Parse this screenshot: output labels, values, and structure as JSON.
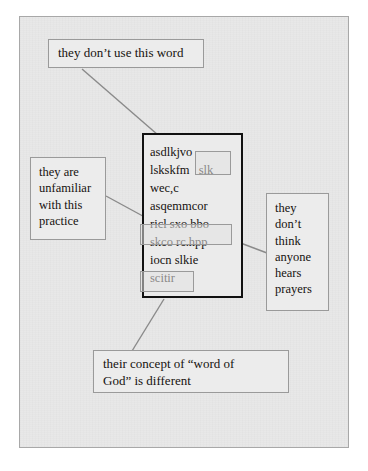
{
  "figure": {
    "type": "annotated-text-diagram",
    "top_cut_text": " ",
    "text_block": {
      "label": "central-passage",
      "lines": [
        "asdlkjvo",
        "lskskfm",
        "wec,c",
        "asqemmcor",
        "ricl sxo",
        "skco rc.hpp",
        "iocn slkie",
        "scitir"
      ],
      "highlights": [
        {
          "name": "slk",
          "text": "slk"
        },
        {
          "name": "bbo",
          "text": "bbo"
        },
        {
          "name": "scitir",
          "text": "scitir"
        }
      ]
    },
    "callouts": {
      "top": {
        "name": "they-dont-use-this-word",
        "lines": [
          "they don’t use this word"
        ]
      },
      "left": {
        "name": "they-are-unfamiliar-with-this-practice",
        "lines": [
          "they are",
          "unfamiliar",
          "with this",
          "practice"
        ]
      },
      "right": {
        "name": "they-dont-think-anyone-hears-prayers",
        "lines": [
          "they",
          "don’t",
          "think",
          "anyone",
          "hears",
          "prayers"
        ]
      },
      "bottom": {
        "name": "their-concept-of-word-of-god-is-different",
        "lines": [
          "their concept of “word of",
          "God” is different"
        ]
      }
    },
    "colors": {
      "page_background": "#ffffff",
      "frame_fill": "#e8e8e8",
      "frame_border": "#a8a8a8",
      "callout_border": "#9a9a9a",
      "callout_fill": "#ececec",
      "text_block_border": "#111111",
      "connector_line": "#8a8a8a",
      "text": "#16120f"
    }
  }
}
